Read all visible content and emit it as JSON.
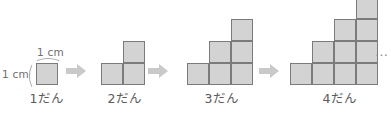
{
  "figure": {
    "unit_cell_px": 22,
    "baseline_y": 85,
    "cell_fill": "#d3d3d3",
    "cell_stroke": "#7b7b7b",
    "arrow_color": "#c9c9c9",
    "background": "#ffffff"
  },
  "measurements": {
    "width_label": "1 cm",
    "height_label": "1 cm"
  },
  "arrows": [
    {
      "name": "arrow-1-to-2",
      "x": 66,
      "y": 64
    },
    {
      "name": "arrow-2-to-3",
      "x": 148,
      "y": 64
    },
    {
      "name": "arrow-3-to-4",
      "x": 259,
      "y": 64
    }
  ],
  "ellipsis": {
    "text": "…",
    "x": 375,
    "y": 44
  },
  "stages": [
    {
      "name": "stage-1",
      "label": "1だん",
      "step_count": 1,
      "column_heights": [
        1
      ],
      "square_count": 1,
      "origin_x": 36,
      "label_x": 24,
      "label_y": 88,
      "label_width": 46
    },
    {
      "name": "stage-2",
      "label": "2だん",
      "step_count": 2,
      "column_heights": [
        1,
        2
      ],
      "square_count": 3,
      "origin_x": 101,
      "label_x": 92,
      "label_y": 88,
      "label_width": 66
    },
    {
      "name": "stage-3",
      "label": "3だん",
      "step_count": 3,
      "column_heights": [
        1,
        2,
        3
      ],
      "square_count": 6,
      "origin_x": 187,
      "label_x": 178,
      "label_y": 88,
      "label_width": 88
    },
    {
      "name": "stage-4",
      "label": "4だん",
      "step_count": 4,
      "column_heights": [
        1,
        2,
        3,
        4
      ],
      "square_count": 10,
      "origin_x": 290,
      "label_x": 285,
      "label_y": 88,
      "label_width": 110
    }
  ]
}
